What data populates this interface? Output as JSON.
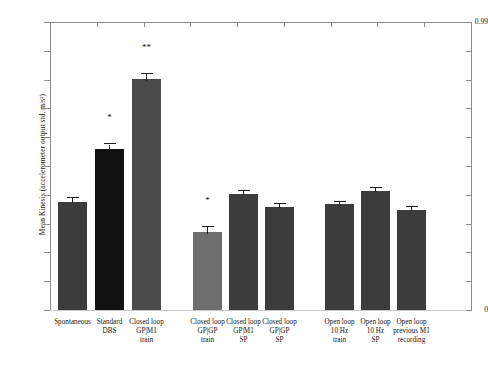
{
  "figure": {
    "background_color": "#ffffff",
    "axis_color": "#8c8c8c",
    "text_color": "#141414"
  },
  "chart_data": {
    "type": "bar",
    "title": "",
    "xlabel": "",
    "ylabel": "Mean Kinesis (accelerometer output std, m/s²)",
    "ylim": [
      0,
      0.99
    ],
    "ytick_labels": [
      "0.99",
      "0"
    ],
    "ytick_values": [
      0.99,
      0
    ],
    "minor_ticks": true,
    "grid": false,
    "legend": "none",
    "categories": [
      "Spontaneous",
      "Standard DBS",
      "Closed loop GP|M1 train",
      "Closed loop GP|GP train",
      "Closed loop GP|M1 SP",
      "Closed loop GP|GP SP",
      "Open loop 10 Hz train",
      "Open loop 10 Hz SP",
      "Open loop previous M1 recording"
    ],
    "category_lines": [
      [
        "Spontaneous"
      ],
      [
        "Standard",
        "DBS"
      ],
      [
        "Closed loop",
        "GP|M1",
        "train"
      ],
      [
        "Closed loop",
        "GP|GP",
        "train"
      ],
      [
        "Closed loop",
        "GP|M1",
        "SP"
      ],
      [
        "Closed loop",
        "GP|GP",
        "SP"
      ],
      [
        "Open loop",
        "10 Hz",
        "train"
      ],
      [
        "Open loop",
        "10 Hz",
        "SP"
      ],
      [
        "Open loop",
        "previous M1",
        "recording"
      ]
    ],
    "values": [
      0.372,
      0.555,
      0.795,
      0.268,
      0.4,
      0.355,
      0.363,
      0.408,
      0.345
    ],
    "errors": [
      0.012,
      0.014,
      0.018,
      0.016,
      0.01,
      0.01,
      0.01,
      0.01,
      0.01
    ],
    "bar_colors": [
      "#3c3c3c",
      "#111111",
      "#4a4a4a",
      "#6e6e6e",
      "#3c3c3c",
      "#3c3c3c",
      "#3c3c3c",
      "#3c3c3c",
      "#3c3c3c"
    ],
    "significance": [
      "",
      "*",
      "**",
      "*",
      "",
      "",
      "",
      "",
      ""
    ],
    "bar_left_px": [
      58,
      95,
      132,
      193,
      229,
      265,
      325,
      361,
      397
    ],
    "bar_width_px": 29
  }
}
